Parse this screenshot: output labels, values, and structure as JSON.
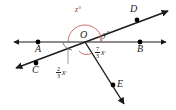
{
  "figure": {
    "vertex_label": "O",
    "points": [
      {
        "id": "A",
        "label": "A",
        "x": 38,
        "y": 42,
        "label_x": 35,
        "label_y": 49
      },
      {
        "id": "B",
        "label": "B",
        "x": 140,
        "y": 42,
        "label_x": 137,
        "label_y": 49
      },
      {
        "id": "C",
        "label": "C",
        "x": 36,
        "y": 63,
        "label_x": 33,
        "label_y": 70
      },
      {
        "id": "D",
        "label": "D",
        "x": 137,
        "y": 20,
        "label_x": 131,
        "label_y": 8
      },
      {
        "id": "E",
        "label": "E",
        "x": 113,
        "y": 85,
        "label_x": 117,
        "label_y": 83
      },
      {
        "id": "O",
        "label": "O",
        "x": 85,
        "y": 42,
        "label_x": 81,
        "label_y": 32
      }
    ],
    "lines": [
      {
        "name": "line-AB",
        "from": "A-side",
        "to": "B-side",
        "arrows": "both"
      },
      {
        "name": "line-CD",
        "from": "C-side",
        "to": "D-side",
        "arrows": "both"
      },
      {
        "name": "ray-OE",
        "from": "O",
        "to": "E-side",
        "arrows": "end"
      }
    ],
    "angles": [
      {
        "id": "z",
        "label": "z",
        "unit": "°",
        "text": "z°",
        "color": "#b03a3a",
        "label_x": 78,
        "label_y": 10,
        "arc": "upper-half-plane at O"
      },
      {
        "id": "y",
        "label": "y",
        "unit": "°",
        "text": "y°",
        "color": "#1a1a1a",
        "label_x": 104,
        "label_y": 34,
        "arc": "between ray OB and ray OD"
      },
      {
        "id": "two-thirds-x",
        "numerator": "2",
        "denominator": "3",
        "variable": "x",
        "unit": "°",
        "text": "2/3 x°",
        "color": "#1a1a1a",
        "label_x": 58,
        "label_y": 73,
        "arc": "between ray OA and ray OC"
      },
      {
        "id": "seven-thirds-x",
        "numerator": "7",
        "denominator": "3",
        "variable": "x",
        "unit": "°",
        "text": "7/3 x°",
        "color": "#1a1a1a",
        "label_x": 97,
        "label_y": 52,
        "arc": "between ray OC and ray OE"
      }
    ],
    "colors": {
      "stroke": "#1a1a1a",
      "accent_arc": "#c06060",
      "background": "#ffffff",
      "point_fill": "#000000"
    }
  }
}
